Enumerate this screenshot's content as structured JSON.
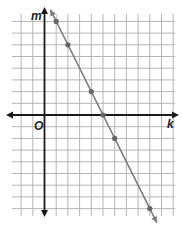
{
  "chart_data": {
    "type": "line",
    "title": "",
    "xlabel": "k",
    "ylabel": "m",
    "origin_label": "O",
    "grid": true,
    "xlim": [
      -2,
      11
    ],
    "ylim": [
      -8,
      8.5
    ],
    "series": [
      {
        "name": "line",
        "equation": "m = -2k + 10",
        "points": [
          {
            "k": 1,
            "m": 8
          },
          {
            "k": 2,
            "m": 6
          },
          {
            "k": 4,
            "m": 2
          },
          {
            "k": 5,
            "m": 0
          },
          {
            "k": 6,
            "m": -2
          },
          {
            "k": 9,
            "m": -8
          }
        ]
      }
    ]
  },
  "labels": {
    "x_axis": "k",
    "y_axis": "m",
    "origin": "O"
  },
  "colors": {
    "grid": "#b5b5b5",
    "axis": "#1a1a1a",
    "line": "#7a7a7a",
    "point": "#666666"
  }
}
